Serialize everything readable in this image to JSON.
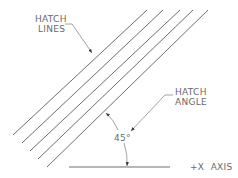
{
  "diagram": {
    "labels": {
      "hatch_lines": [
        "HATCH",
        "LINES"
      ],
      "hatch_angle": [
        "HATCH",
        "ANGLE"
      ],
      "angle_value": "45°",
      "x_axis": "+X  AXIS"
    },
    "hatch_lines": [
      {
        "x1": 13,
        "y1": 135,
        "x2": 147,
        "y2": 10
      },
      {
        "x1": 22,
        "y1": 143,
        "x2": 163,
        "y2": 10
      },
      {
        "x1": 30,
        "y1": 151,
        "x2": 180,
        "y2": 10
      },
      {
        "x1": 38,
        "y1": 159,
        "x2": 193,
        "y2": 10
      },
      {
        "x1": 47,
        "y1": 167,
        "x2": 208,
        "y2": 10
      }
    ],
    "x_axis_line": {
      "x1": 69,
      "y1": 167,
      "x2": 170,
      "y2": 167
    },
    "colors": {
      "stroke": "#6e6e6e",
      "text": "#6a6a6a",
      "background": "#ffffff"
    }
  }
}
